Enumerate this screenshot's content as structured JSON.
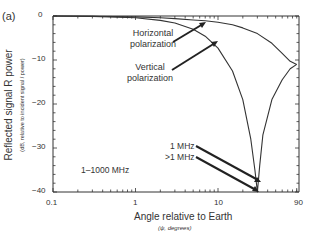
{
  "panel_label": "(a)",
  "chart_data": {
    "type": "line",
    "title": "",
    "xlabel": "Angle relative to Earth",
    "xlabel_sub": "(ψ, degrees)",
    "ylabel": "Reflected signal R power",
    "ylabel_sub": "(dB, relative to incident signal / power)",
    "xscale": "log",
    "xlim": [
      0.1,
      90
    ],
    "ylim": [
      -40,
      0
    ],
    "x_ticks": [
      "0.1",
      "1",
      "10",
      "90"
    ],
    "y_ticks": [
      "0",
      "−10",
      "−20",
      "−30",
      "−40"
    ],
    "grid": false,
    "series": [
      {
        "name": "Horizontal polarization",
        "x": [
          0.1,
          0.3,
          1,
          2,
          3,
          5,
          7,
          10,
          15,
          20,
          30,
          45,
          60,
          75,
          90
        ],
        "y": [
          0,
          -0.05,
          -0.2,
          -0.4,
          -0.6,
          -0.9,
          -1.1,
          -1.4,
          -2.0,
          -2.7,
          -4.0,
          -6.2,
          -8.5,
          -10.3,
          -11
        ]
      },
      {
        "name": "Vertical polarization",
        "x": [
          0.1,
          0.3,
          1,
          2,
          3,
          5,
          7,
          10,
          15,
          20,
          25,
          28,
          30,
          32,
          35,
          45,
          60,
          75,
          90
        ],
        "y": [
          0,
          -0.1,
          -0.4,
          -1.0,
          -1.6,
          -3.0,
          -4.6,
          -7.3,
          -12.5,
          -19,
          -28,
          -35,
          -40,
          -34,
          -27,
          -19,
          -14.5,
          -12,
          -11
        ]
      }
    ],
    "annotations": [
      {
        "text": "Horizontal\npolarization",
        "target": "Horizontal polarization"
      },
      {
        "text": "Vertical\npolarization",
        "target": "Vertical polarization"
      },
      {
        "text": "1 MHz",
        "target": "minimum at ~30°"
      },
      {
        "text": ">1 MHz",
        "target": "minimum at ~30°"
      },
      {
        "text": "1–1000 MHz",
        "target": "frequency range"
      }
    ]
  },
  "labels": {
    "horizontal_1": "Horizontal",
    "horizontal_2": "polarization",
    "vertical_1": "Vertical",
    "vertical_2": "polarization",
    "mhz_1": "1 MHz",
    "mhz_gt1": ">1 MHz",
    "range": "1–1000 MHz",
    "ytick_0": "0",
    "ytick_10": "−10",
    "ytick_20": "−20",
    "ytick_30": "−30",
    "ytick_40": "−40",
    "xtick_01": "0.1",
    "xtick_1": "1",
    "xtick_10": "10",
    "xtick_90": "90"
  }
}
